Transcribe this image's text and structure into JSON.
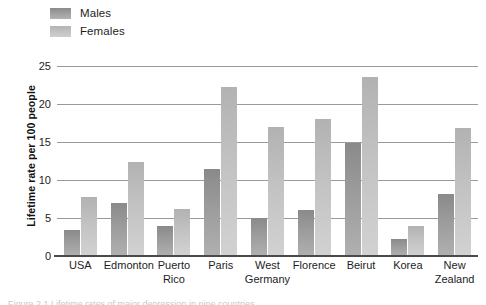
{
  "chart_data": {
    "type": "bar",
    "title": "",
    "xlabel": "",
    "ylabel": "Lifetime rate per 100 people",
    "ylim": [
      0,
      25
    ],
    "yticks": [
      0,
      5,
      10,
      15,
      20,
      25
    ],
    "grid": true,
    "legend_position": "top-left",
    "categories": [
      "USA",
      "Edmonton",
      "Puerto Rico",
      "Paris",
      "West Germany",
      "Florence",
      "Beirut",
      "Korea",
      "New Zealand"
    ],
    "category_lines": [
      [
        "USA",
        ""
      ],
      [
        "Edmonton",
        ""
      ],
      [
        "Puerto",
        "Rico"
      ],
      [
        "Paris",
        ""
      ],
      [
        "West",
        "Germany"
      ],
      [
        "Florence",
        ""
      ],
      [
        "Beirut",
        ""
      ],
      [
        "Korea",
        ""
      ],
      [
        "New",
        "Zealand"
      ]
    ],
    "series": [
      {
        "name": "Males",
        "color": "#9c9c9c",
        "values": [
          3.4,
          7.0,
          4.0,
          11.5,
          5.0,
          6.0,
          14.9,
          2.3,
          8.2
        ]
      },
      {
        "name": "Females",
        "color": "#c2c2c2",
        "values": [
          7.8,
          12.4,
          6.2,
          22.3,
          17.0,
          18.0,
          23.5,
          4.0,
          16.8
        ]
      }
    ]
  },
  "legend": {
    "items": [
      {
        "label": "Males"
      },
      {
        "label": "Females"
      }
    ]
  },
  "axis": {
    "y_title": "Lifetime rate per 100 people",
    "y_tick_labels": [
      "25",
      "20",
      "15",
      "10",
      "5",
      "0"
    ]
  },
  "caption": {
    "text": "Figure 2.1  Lifetime rates of major depression in nine countries"
  }
}
